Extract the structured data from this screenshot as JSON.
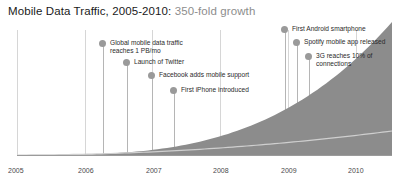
{
  "title": {
    "main": "Mobile Data Traffic, 2005-2010: ",
    "highlight": "350-fold growth"
  },
  "colors": {
    "area_fill": "#8c8c8c",
    "inner_line": "#cfcfcf",
    "marker": "#9a9a9a",
    "connector": "#b5b5b5",
    "gridline": "#d6d6d6",
    "axis": "#9b9b9b",
    "title_main": "#1a1a1a",
    "title_sub": "#8d8d8d",
    "tick_text": "#4a4a4a"
  },
  "annotations": [
    {
      "label": "Global mobile data traffic\nreaches 1 PB/mo",
      "dot_x": 99,
      "dot_y": 39,
      "line_x": 103,
      "line_top": 46,
      "line_bottom": 155
    },
    {
      "label": "Launch of Twitter",
      "dot_x": 123,
      "dot_y": 58,
      "line_x": 127,
      "line_top": 65,
      "line_bottom": 155
    },
    {
      "label": "Facebook adds mobile support",
      "dot_x": 148,
      "dot_y": 71,
      "line_x": 152,
      "line_top": 78,
      "line_bottom": 155
    },
    {
      "label": "First iPhone introduced",
      "dot_x": 170,
      "dot_y": 86,
      "line_x": 174,
      "line_top": 93,
      "line_bottom": 155
    },
    {
      "label": "First Android smartphone",
      "dot_x": 281,
      "dot_y": 25,
      "line_x": 285,
      "line_top": 32,
      "line_bottom": 155
    },
    {
      "label": "Spotify mobile app released",
      "dot_x": 293,
      "dot_y": 38,
      "line_x": 297,
      "line_top": 45,
      "line_bottom": 155
    },
    {
      "label": "3G reaches 10% of\nconnections",
      "dot_x": 305,
      "dot_y": 52,
      "line_x": 309,
      "line_top": 59,
      "line_bottom": 155
    }
  ],
  "axis_ticks": [
    {
      "label": "2005",
      "x": 8
    },
    {
      "label": "2006",
      "x": 78
    },
    {
      "label": "2007",
      "x": 146
    },
    {
      "label": "2008",
      "x": 213
    },
    {
      "label": "2009",
      "x": 281
    },
    {
      "label": "2010",
      "x": 348
    }
  ],
  "gridlines_x": [
    17,
    85,
    152,
    220,
    288,
    356
  ],
  "chart_data": {
    "type": "area",
    "title": "Mobile Data Traffic, 2005-2010: 350-fold growth",
    "xlabel": "",
    "ylabel": "",
    "grid": true,
    "legend": "none",
    "x": [
      "2005",
      "2005.5",
      "2006",
      "2006.5",
      "2007",
      "2007.5",
      "2008",
      "2008.5",
      "2009",
      "2009.5",
      "2010"
    ],
    "xlim": [
      "2005",
      "2010"
    ],
    "ylim": [
      0,
      350
    ],
    "series": [
      {
        "name": "Total mobile data traffic (index, 2005 = 1)",
        "values": [
          1,
          2,
          4,
          8,
          16,
          28,
          45,
          75,
          125,
          215,
          350
        ]
      },
      {
        "name": "Non-smartphone / baseline traffic",
        "values": [
          0,
          1,
          2,
          4,
          7,
          12,
          20,
          30,
          40,
          45,
          48
        ]
      }
    ],
    "annotations": [
      {
        "text": "Global mobile data traffic reaches 1 PB/mo",
        "x": "2006"
      },
      {
        "text": "Launch of Twitter",
        "x": "2006.3"
      },
      {
        "text": "Facebook adds mobile support",
        "x": "2006.7"
      },
      {
        "text": "First iPhone introduced",
        "x": "2007"
      },
      {
        "text": "First Android smartphone",
        "x": "2008.7"
      },
      {
        "text": "Spotify mobile app released",
        "x": "2008.9"
      },
      {
        "text": "3G reaches 10% of connections",
        "x": "2009.1"
      }
    ]
  }
}
